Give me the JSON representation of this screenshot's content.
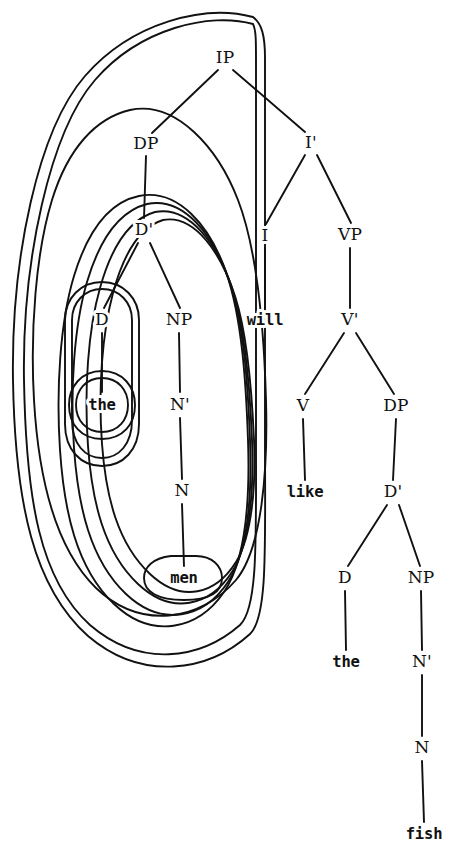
{
  "figure": {
    "ink_color": "#111111",
    "background_color": "#ffffff",
    "sentence": "the men will like the fish"
  },
  "nodes": {
    "ip": {
      "label": "IP",
      "x": 225,
      "y": 58,
      "kind": "category"
    },
    "dp_subj": {
      "label": "DP",
      "x": 146,
      "y": 144,
      "kind": "category"
    },
    "ibar": {
      "label": "I'",
      "x": 311,
      "y": 143,
      "kind": "category"
    },
    "dbar_subj": {
      "label": "D'",
      "x": 144,
      "y": 230,
      "kind": "category"
    },
    "i_head": {
      "label": "I",
      "x": 265,
      "y": 236,
      "kind": "category"
    },
    "vp": {
      "label": "VP",
      "x": 350,
      "y": 235,
      "kind": "category"
    },
    "d_subj": {
      "label": "D",
      "x": 102,
      "y": 320,
      "kind": "category"
    },
    "np_subj": {
      "label": "NP",
      "x": 179,
      "y": 320,
      "kind": "category"
    },
    "will": {
      "label": "will",
      "x": 265,
      "y": 320,
      "kind": "terminal"
    },
    "vbar": {
      "label": "V'",
      "x": 350,
      "y": 320,
      "kind": "category"
    },
    "the_subj": {
      "label": "the",
      "x": 102,
      "y": 405,
      "kind": "terminal"
    },
    "nbar_subj": {
      "label": "N'",
      "x": 180,
      "y": 405,
      "kind": "category"
    },
    "v_head": {
      "label": "V",
      "x": 303,
      "y": 406,
      "kind": "category"
    },
    "dp_obj": {
      "label": "DP",
      "x": 396,
      "y": 406,
      "kind": "category"
    },
    "n_subj": {
      "label": "N",
      "x": 182,
      "y": 491,
      "kind": "category"
    },
    "like": {
      "label": "like",
      "x": 305,
      "y": 492,
      "kind": "terminal"
    },
    "dbar_obj": {
      "label": "D'",
      "x": 393,
      "y": 492,
      "kind": "category"
    },
    "men": {
      "label": "men",
      "x": 184,
      "y": 578,
      "kind": "terminal"
    },
    "d_obj": {
      "label": "D",
      "x": 345,
      "y": 578,
      "kind": "category"
    },
    "np_obj": {
      "label": "NP",
      "x": 421,
      "y": 578,
      "kind": "category"
    },
    "the_obj": {
      "label": "the",
      "x": 346,
      "y": 662,
      "kind": "terminal"
    },
    "nbar_obj": {
      "label": "N'",
      "x": 422,
      "y": 662,
      "kind": "category"
    },
    "n_obj": {
      "label": "N",
      "x": 422,
      "y": 748,
      "kind": "category"
    },
    "fish": {
      "label": "fish",
      "x": 424,
      "y": 834,
      "kind": "terminal"
    }
  },
  "branches": [
    {
      "name": "ip-to-dp",
      "d": "M 218 70 L 152 133"
    },
    {
      "name": "ip-to-ibar",
      "d": "M 233 70 L 305 132"
    },
    {
      "name": "dp-to-dbar",
      "d": "M 146 156 L 144 218"
    },
    {
      "name": "ibar-to-i",
      "d": "M 305 155 L 266 224"
    },
    {
      "name": "ibar-to-vp",
      "d": "M 317 155 L 351 223"
    },
    {
      "name": "dbar-to-d",
      "d": "M 138 243 L 104 308"
    },
    {
      "name": "dbar-to-np",
      "d": "M 150 243 L 180 308"
    },
    {
      "name": "i-to-will",
      "d": "M 265 248 L 265 308"
    },
    {
      "name": "vp-to-vbar",
      "d": "M 350 248 L 350 308"
    },
    {
      "name": "d-to-the-subj",
      "d": "M 102 333 L 102 392"
    },
    {
      "name": "np-to-nbar-subj",
      "d": "M 179 333 L 180 392"
    },
    {
      "name": "vbar-to-v",
      "d": "M 344 333 L 305 394"
    },
    {
      "name": "vbar-to-dp-obj",
      "d": "M 356 333 L 394 394"
    },
    {
      "name": "nbar-to-n-subj",
      "d": "M 180 418 L 182 479"
    },
    {
      "name": "v-to-like",
      "d": "M 303 419 L 305 480"
    },
    {
      "name": "dp-to-dbar-obj",
      "d": "M 396 419 L 393 480"
    },
    {
      "name": "n-to-men",
      "d": "M 182 504 L 184 566"
    },
    {
      "name": "dbar-to-d-obj",
      "d": "M 387 505 L 348 566"
    },
    {
      "name": "dbar-to-np-obj",
      "d": "M 399 505 L 420 566"
    },
    {
      "name": "d-to-the-obj",
      "d": "M 345 591 L 346 650"
    },
    {
      "name": "np-to-nbar-obj",
      "d": "M 421 591 L 422 650"
    },
    {
      "name": "nbar-to-n-obj",
      "d": "M 422 675 L 422 736"
    },
    {
      "name": "n-to-fish",
      "d": "M 422 761 L 424 822"
    }
  ],
  "loops": [
    {
      "name": "loop-ip",
      "covers": "IP (whole clause)",
      "d": "M 253 24 C 210 12 140 28 95 80 C 50 132 22 260 24 380 C 26 500 40 580 90 625 C 140 668 200 660 240 625 C 258 608 256 540 256 440 L 256 60 C 256 40 256 30 253 24 Z"
    },
    {
      "name": "loop-ip-outer",
      "covers": "IP (outer tracing line)",
      "d": "M 253 17 C 205 4 132 22 85 76 C 38 130 11 258 13 380 C 15 504 34 588 88 636 C 142 682 208 672 250 634 C 268 617 265 545 265 440 L 265 58 C 265 36 262 24 253 17 Z"
    },
    {
      "name": "loop-dp-subject",
      "covers": "DP (the men)",
      "d": "M 130 110 C 96 118 68 148 52 200 C 36 252 30 330 34 400 C 38 470 52 545 96 588 C 140 630 200 622 236 580 C 262 549 268 470 266 400 C 264 330 258 252 238 200 C 218 148 176 100 130 110 Z"
    },
    {
      "name": "loop-dbar-subject",
      "covers": "D' (the men)",
      "d": "M 139 196 C 110 202 88 230 74 276 C 60 322 56 390 60 450 C 64 510 76 568 114 604 C 152 640 198 630 224 592 C 246 560 250 498 248 440 C 246 382 242 318 226 272 C 210 226 178 188 139 196 Z"
    },
    {
      "name": "loop-np-subject",
      "covers": "NP (men)",
      "d": "M 147 204 C 120 211 100 238 87 282 C 74 326 70 390 74 448 C 78 506 90 560 126 594 C 162 628 204 618 228 582 C 248 552 252 494 250 440 C 248 386 244 324 229 280 C 214 236 184 196 147 204 Z"
    },
    {
      "name": "loop-nbar-subject",
      "covers": "N' (men)",
      "d": "M 155 212 C 130 219 112 245 100 288 C 88 330 84 390 88 446 C 92 502 104 552 138 584 C 172 616 210 606 232 572 C 250 544 254 490 252 440 C 250 390 246 330 232 288 C 218 246 190 205 155 212 Z"
    },
    {
      "name": "loop-n-subject",
      "covers": "N (men)",
      "d": "M 163 220 C 140 227 124 252 113 293 C 102 334 98 390 102 444 C 106 498 118 544 150 574 C 182 604 216 594 236 562 C 252 536 256 486 254 440 C 252 394 248 336 235 296 C 222 256 196 214 163 220 Z"
    },
    {
      "name": "loop-d-subject",
      "covers": "D (the)",
      "d": "M 102 289 C 85 289 72 302 72 320 L 72 420 C 72 444 85 458 102 458 C 119 458 132 444 132 420 L 132 320 C 132 302 119 289 102 289 Z"
    },
    {
      "name": "loop-d-subject-outer",
      "covers": "D (the) outer tracing line",
      "d": "M 102 282 C 81 282 65 298 65 320 L 65 424 C 65 450 81 466 102 466 C 123 466 139 450 139 424 L 139 320 C 139 298 123 282 102 282 Z"
    },
    {
      "name": "loop-the-subject",
      "covers": "the (terminal, subject)",
      "d": "M 102 378 C 86 378 76 390 76 405 C 76 420 86 432 102 432 C 118 432 128 420 128 405 C 128 390 118 378 102 378 Z"
    },
    {
      "name": "loop-the-subject-outer",
      "covers": "the (terminal, subject) outer tracing line",
      "d": "M 102 371 C 81 371 69 387 69 405 C 69 424 81 439 102 439 C 123 439 135 424 135 405 C 135 387 123 371 102 371 Z"
    },
    {
      "name": "loop-men-terminal",
      "covers": "men (terminal)",
      "d": "M 171 556 C 152 558 144 568 144 578 C 144 592 158 600 184 600 C 210 600 222 592 222 578 C 222 566 212 556 196 556 Z"
    }
  ],
  "legend": {
    "note": "Concentric loops mark constituents: IP, DP, D', NP, N', N, D and the terminal nodes."
  }
}
